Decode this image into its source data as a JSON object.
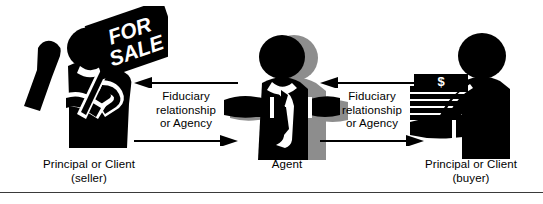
{
  "diagram": {
    "background_color": "#ffffff",
    "ink_color": "#000000",
    "shadow_color": "#8d8d8d",
    "rule_color": "#3a3a3a"
  },
  "sign": {
    "line1": "FOR",
    "line2": "SALE",
    "text_color": "#ffffff",
    "board_color": "#000000"
  },
  "money": {
    "symbol": "$",
    "note_count": 7
  },
  "relations": [
    {
      "id": "seller-agent",
      "label": "Fiduciary\nrelationship\nor Agency",
      "top_arrow_direction": "left",
      "bottom_arrow_direction": "right"
    },
    {
      "id": "agent-buyer",
      "label": "Fiduciary\nrelationship\nor Agency",
      "top_arrow_direction": "left",
      "bottom_arrow_direction": "right"
    }
  ],
  "figures": [
    {
      "id": "seller",
      "caption": "Principal or Client\n(seller)",
      "role": "Principal or Client",
      "qualifier": "(seller)",
      "holds": "for-sale-sign"
    },
    {
      "id": "agent",
      "caption": "Agent",
      "role": "Agent",
      "qualifier": "",
      "holds": "none"
    },
    {
      "id": "buyer",
      "caption": "Principal or Client\n(buyer)",
      "role": "Principal or Client",
      "qualifier": "(buyer)",
      "holds": "money-stack"
    }
  ]
}
